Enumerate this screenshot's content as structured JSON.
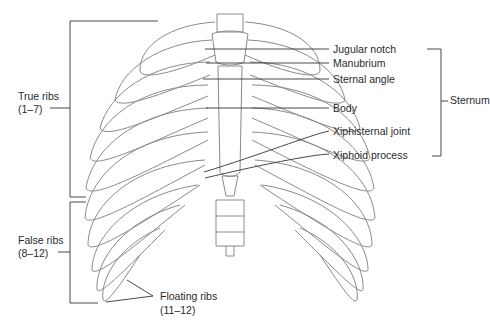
{
  "figure": {
    "colors": {
      "line": "#333333",
      "bone_stroke": "#8a8a8a",
      "text": "#2a2a2a",
      "background": "#ffffff"
    }
  },
  "labels": {
    "left": {
      "true_ribs": {
        "line1": "True ribs",
        "line2": "(1–7)"
      },
      "false_ribs": {
        "line1": "False ribs",
        "line2": "(8–12)"
      }
    },
    "bottom": {
      "floating_ribs": {
        "line1": "Floating ribs",
        "line2": "(11–12)"
      }
    },
    "right": {
      "jugular_notch": "Jugular notch",
      "manubrium": "Manubrium",
      "sternal_angle": "Sternal angle",
      "body": "Body",
      "xiphisternal_joint": "Xiphisternal joint",
      "xiphoid_process": "Xiphoid process"
    },
    "group": {
      "sternum": "Sternum"
    }
  }
}
